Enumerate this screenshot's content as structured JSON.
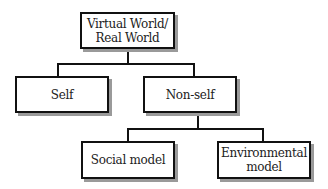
{
  "diagram": {
    "type": "hierarchy",
    "root": {
      "line1": "Virtual World/",
      "line2": "Real World"
    },
    "level1": [
      {
        "label": "Self"
      },
      {
        "label": "Non-self"
      }
    ],
    "level2": [
      {
        "label": "Social model"
      },
      {
        "line1": "Environmental",
        "line2": "model"
      }
    ]
  },
  "colors": {
    "border": "#111111",
    "shadow": "#9a9a9a",
    "background": "#ffffff"
  }
}
